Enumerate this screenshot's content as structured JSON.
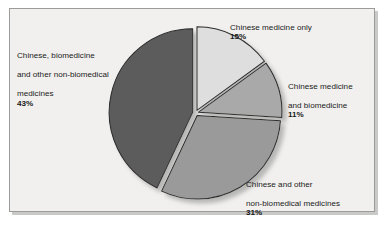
{
  "chart_data": {
    "type": "pie",
    "title": "",
    "categories": [
      "Chinese medicine only",
      "Chinese medicine and biomedicine",
      "Chinese and other non-biomedical medicines",
      "Chinese, biomedicine and other non-biomedical medicines"
    ],
    "values": [
      15,
      11,
      31,
      43
    ],
    "value_labels": [
      "15%",
      "11%",
      "31%",
      "43%"
    ],
    "units": "percent",
    "legend": "none",
    "labels_position": "outside",
    "colors": [
      "#dedede",
      "#a9a9a9",
      "#9a9a9a",
      "#5c5c5c"
    ],
    "slice_order": "clockwise-from-top",
    "exploded": true,
    "grid": false
  },
  "figure": {
    "background_color": "#f1f0ee",
    "border_color": "#9b9b9b",
    "shadow_color": "#c9c9c7"
  },
  "slices": [
    {
      "id": "chinese-medicine-only",
      "label_line1": "Chinese medicine only",
      "percent": "15%",
      "color": "#dedede"
    },
    {
      "id": "chinese-medicine-and-biomedicine",
      "label_line1": "Chinese medicine",
      "label_line2": "and biomedicine",
      "percent": "11%",
      "color": "#a9a9a9"
    },
    {
      "id": "chinese-and-other-non-biomedical",
      "label_line1": "Chinese and other",
      "label_line2": "non-biomedical medicines",
      "percent": "31%",
      "color": "#9a9a9a"
    },
    {
      "id": "chinese-biomedicine-and-other",
      "label_line1": "Chinese, biomedicine",
      "label_line2": "and other non-biomedical",
      "label_line3": "medicines",
      "percent": "43%",
      "color": "#5c5c5c"
    }
  ]
}
